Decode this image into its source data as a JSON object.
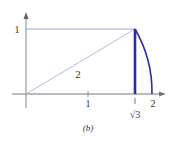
{
  "figure": {
    "caption": "(b)",
    "axes": {
      "x_tick_labels": [
        "1",
        "2"
      ],
      "y_tick_labels": [
        "1"
      ],
      "special_x_label": "√3"
    },
    "hypotenuse_label": "2",
    "colors": {
      "axis": "#777777",
      "thin_line": "#9a9ad8",
      "accent": "#2e2e9e",
      "text": "#333333"
    },
    "geometry": {
      "origin": [
        0,
        0
      ],
      "point_on_arc": [
        1.732,
        1
      ],
      "radius": 2
    }
  }
}
